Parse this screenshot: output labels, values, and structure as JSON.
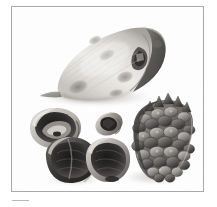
{
  "page": {
    "background_color": "#ffffff",
    "width": 217,
    "height": 207
  },
  "plate": {
    "name": "botanical-specimen-photograph",
    "border_color": "#a9a9a9",
    "background_color": "#ffffff",
    "alt_text": "Black and white photograph of a large dried seed pod, several cracked open nut shells, a single small seed and a pine cone arranged on a white background",
    "caption_rule_color": "#b8b8b8"
  },
  "specimens": [
    {
      "id": "seed-pod",
      "label": "large dried seed pod",
      "tone_light": "#e8e6e2",
      "tone_mid": "#b9b6b0",
      "tone_dark": "#6d6a66",
      "tone_darkest": "#3f3d3b"
    },
    {
      "id": "cracked-shell-upper",
      "label": "cracked open nut shell, upper",
      "tone_light": "#d8d5d0",
      "tone_mid": "#8f8c87",
      "tone_dark": "#4a4846",
      "tone_darkest": "#272625"
    },
    {
      "id": "cracked-shell-lower-left",
      "label": "cracked open nut shell, lower left",
      "tone_light": "#cfccc7",
      "tone_mid": "#7e7b77",
      "tone_dark": "#3a3937",
      "tone_darkest": "#1c1b1b"
    },
    {
      "id": "cracked-shell-lower-right",
      "label": "cracked open nut shell, lower right",
      "tone_light": "#c9c6c1",
      "tone_mid": "#76736f",
      "tone_dark": "#3c3a38",
      "tone_darkest": "#211f1f"
    },
    {
      "id": "single-seed",
      "label": "single small seed",
      "tone_light": "#c2bfba",
      "tone_mid": "#7d7a76",
      "tone_dark": "#3a3837",
      "tone_darkest": "#1b1a1a"
    },
    {
      "id": "pine-cone",
      "label": "pine cone",
      "tone_light": "#bbb8b3",
      "tone_mid": "#7c7975",
      "tone_dark": "#4a4846",
      "tone_darkest": "#242322"
    }
  ],
  "shadow": {
    "color": "#c9c7c4",
    "label": "soft cast shadow"
  }
}
